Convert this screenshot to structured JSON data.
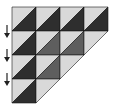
{
  "diagram": {
    "grid": {
      "origin_x": 12,
      "origin_y": 7,
      "cell": 24
    },
    "colors": {
      "light": "#d9d9d9",
      "dark": "#2e2e2e",
      "medium": "#5e5e5e",
      "outline": "#1a1a1a",
      "arrow": "#222222"
    },
    "rows": [
      {
        "cells": [
          "dark",
          "dark",
          "dark",
          "dark"
        ],
        "tail": false
      },
      {
        "cells": [
          "dark",
          "medium",
          "medium"
        ],
        "tail": true
      },
      {
        "cells": [
          "dark",
          "medium"
        ],
        "tail": true
      },
      {
        "cells": [
          "dark"
        ],
        "tail": true
      }
    ],
    "arrows": [
      {
        "row": 1,
        "direction": "down"
      },
      {
        "row": 2,
        "direction": "down"
      },
      {
        "row": 3,
        "direction": "down"
      }
    ]
  }
}
